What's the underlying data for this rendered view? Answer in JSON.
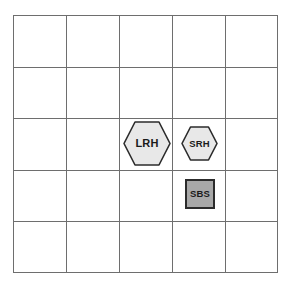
{
  "diagram": {
    "title": "",
    "background_color": "#ffffff",
    "grid": {
      "columns": 5,
      "rows": 5,
      "line_color": "#6e6e6e",
      "cell_fill": "#ffffff",
      "x_positions": [
        13,
        66,
        119,
        172,
        225,
        277
      ],
      "y_positions": [
        15,
        67,
        118,
        170,
        221,
        272
      ]
    },
    "shapes": [
      {
        "id": "lrh",
        "label": "LRH",
        "form": "hexagon",
        "size": "large",
        "fill_color": "#e8e8e8",
        "stroke_color": "#2b2b2b",
        "grid_column": 3,
        "grid_row": 3
      },
      {
        "id": "srh",
        "label": "SRH",
        "form": "hexagon",
        "size": "small",
        "fill_color": "#e8e8e8",
        "stroke_color": "#2b2b2b",
        "grid_column": 4,
        "grid_row": 3
      },
      {
        "id": "sbs",
        "label": "SBS",
        "form": "square",
        "size": "small",
        "fill_color": "#a8a8a8",
        "stroke_color": "#2b2b2b",
        "grid_column": 4,
        "grid_row": 4
      }
    ]
  }
}
